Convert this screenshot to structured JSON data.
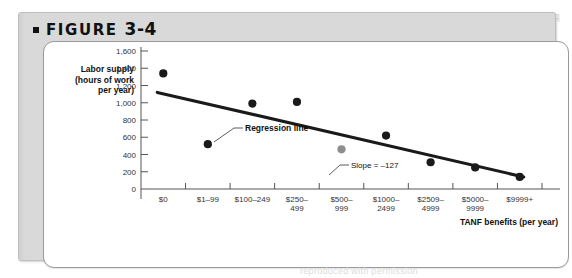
{
  "figure": {
    "label": "FIGURE",
    "number": "3-4",
    "bullet_icon": "square-bullet-icon"
  },
  "watermark": {
    "ghost_text": "FIGURE 3-4",
    "under_text": "reproduced with permission"
  },
  "colors": {
    "card_background": "#d9d9d9",
    "panel_background": "#ffffff",
    "panel_border": "#9a9a9a",
    "axis": "#555555",
    "line": "#1a1a1a",
    "dot": "#1a1a1a",
    "dot_highlight": "#8e8e8e"
  },
  "chart_data": {
    "type": "scatter",
    "title": "",
    "ylabel_lines": [
      "Labor supply",
      "(hours of work",
      "per year)"
    ],
    "ylabel": "Labor supply (hours of work per year)",
    "xlabel": "TANF benefits (per year)",
    "categories": [
      "$0",
      "$1–99",
      "$100–249",
      "$250–499",
      "$500–999",
      "$1000–2499",
      "$2509–4999",
      "$5000–9999",
      "$9999+"
    ],
    "category_lines": [
      [
        "$0"
      ],
      [
        "$1–99"
      ],
      [
        "$100–249"
      ],
      [
        "$250–",
        "499"
      ],
      [
        "$500–",
        "999"
      ],
      [
        "$1000–",
        "2499"
      ],
      [
        "$2509–",
        "4999"
      ],
      [
        "$5000–",
        "9999"
      ],
      [
        "$9999+"
      ]
    ],
    "values": [
      1340,
      520,
      990,
      1010,
      460,
      620,
      310,
      250,
      140
    ],
    "point_colors": [
      "#1a1a1a",
      "#1a1a1a",
      "#1a1a1a",
      "#1a1a1a",
      "#8e8e8e",
      "#1a1a1a",
      "#1a1a1a",
      "#1a1a1a",
      "#1a1a1a"
    ],
    "ylim": [
      0,
      1600
    ],
    "yticks": [
      0,
      200,
      400,
      600,
      800,
      1000,
      1200,
      1400,
      1600
    ],
    "ytick_labels": [
      "0",
      "200",
      "400",
      "600",
      "800",
      "1,000",
      "1,200",
      "1,400",
      "1,600"
    ],
    "grid": false,
    "legend": "none",
    "annotations": [
      {
        "name": "regression-line-label",
        "text": "Regression line"
      },
      {
        "name": "slope-label",
        "text": "Slope = –127"
      }
    ],
    "trendline": {
      "name": "regression-line",
      "slope": -127,
      "start_value": 1120,
      "end_value": 140
    }
  }
}
